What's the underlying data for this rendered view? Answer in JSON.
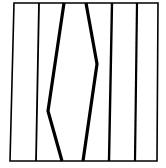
{
  "diagram": {
    "background": "#ffffff",
    "stroke_color": "#000000",
    "frame": {
      "points": [
        [
          14,
          3
        ],
        [
          158,
          3
        ],
        [
          157,
          161
        ],
        [
          10,
          161
        ]
      ],
      "stroke_width": 1.6
    },
    "lines": [
      {
        "id": "line-1",
        "points": [
          [
            39,
            3
          ],
          [
            36,
            161
          ]
        ],
        "stroke_width": 1.8
      },
      {
        "id": "line-2-kinked",
        "points": [
          [
            64,
            3
          ],
          [
            48,
            111
          ],
          [
            62,
            161
          ]
        ],
        "stroke_width": 3.2
      },
      {
        "id": "line-3-kinked",
        "points": [
          [
            86,
            3
          ],
          [
            97,
            64
          ],
          [
            83,
            161
          ]
        ],
        "stroke_width": 3.2
      },
      {
        "id": "line-4",
        "points": [
          [
            112,
            3
          ],
          [
            109,
            161
          ]
        ],
        "stroke_width": 2.4
      },
      {
        "id": "line-5",
        "points": [
          [
            137,
            3
          ],
          [
            135,
            161
          ]
        ],
        "stroke_width": 2.2
      }
    ]
  }
}
